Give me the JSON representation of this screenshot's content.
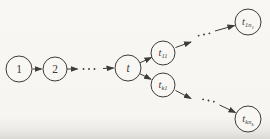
{
  "figure": {
    "colors": {
      "ink": "#3d3c38",
      "paper": "#f8f7f4"
    },
    "canvas": {
      "width": 270,
      "height": 139
    },
    "nodes": [
      {
        "id": "1",
        "x": 19,
        "y": 69,
        "r": 13,
        "label": {
          "main": "1",
          "sub": "",
          "subsub": ""
        }
      },
      {
        "id": "2",
        "x": 55,
        "y": 69,
        "r": 12,
        "label": {
          "main": "2",
          "sub": "",
          "subsub": ""
        }
      },
      {
        "id": "t",
        "x": 128,
        "y": 68,
        "r": 13,
        "label": {
          "main": "t",
          "sub": "",
          "subsub": ""
        }
      },
      {
        "id": "t11",
        "x": 163,
        "y": 53,
        "r": 12,
        "label": {
          "main": "t",
          "sub": "11",
          "subsub": ""
        }
      },
      {
        "id": "tk1",
        "x": 163,
        "y": 85,
        "r": 12,
        "label": {
          "main": "t",
          "sub": "k1",
          "subsub": ""
        }
      },
      {
        "id": "t1n1",
        "x": 248,
        "y": 22,
        "r": 13,
        "label": {
          "main": "t",
          "sub": "1n",
          "subsub": "1"
        }
      },
      {
        "id": "tknk",
        "x": 248,
        "y": 119,
        "r": 13,
        "label": {
          "main": "t",
          "sub": "kn",
          "subsub": "k"
        }
      }
    ],
    "edges": [
      {
        "from": "1",
        "to": "2",
        "x1": 32.5,
        "y1": 69,
        "x2": 41.5,
        "y2": 69
      },
      {
        "from": "2",
        "to": "dots-mid",
        "x1": 67,
        "y1": 69,
        "x2": 77.5,
        "y2": 69
      },
      {
        "from": "dots-mid",
        "to": "t",
        "x1": 103,
        "y1": 68.5,
        "x2": 113.5,
        "y2": 68
      },
      {
        "from": "t",
        "to": "t11",
        "x1": 140,
        "y1": 62.8,
        "x2": 151.5,
        "y2": 57.5
      },
      {
        "from": "t",
        "to": "tk1",
        "x1": 139.7,
        "y1": 73.7,
        "x2": 151,
        "y2": 79.3
      },
      {
        "from": "t11",
        "to": "dots-upper",
        "x1": 175.5,
        "y1": 47.5,
        "x2": 191,
        "y2": 42
      },
      {
        "from": "dots-upper",
        "to": "t1n1",
        "x1": 215,
        "y1": 31,
        "x2": 234.5,
        "y2": 25.5
      },
      {
        "from": "tk1",
        "to": "dots-lower",
        "x1": 175.5,
        "y1": 90.5,
        "x2": 191,
        "y2": 98.5
      },
      {
        "from": "dots-lower",
        "to": "tknk",
        "x1": 219.5,
        "y1": 105,
        "x2": 235.5,
        "y2": 112.5
      }
    ],
    "ellipses": [
      {
        "id": "ellipsis-mid",
        "x": 89,
        "y": 69,
        "angle": 0
      },
      {
        "id": "ellipsis-upper",
        "x": 204,
        "y": 34.5,
        "angle": -12
      },
      {
        "id": "ellipsis-lower",
        "x": 208.5,
        "y": 100.5,
        "angle": 12
      }
    ]
  }
}
